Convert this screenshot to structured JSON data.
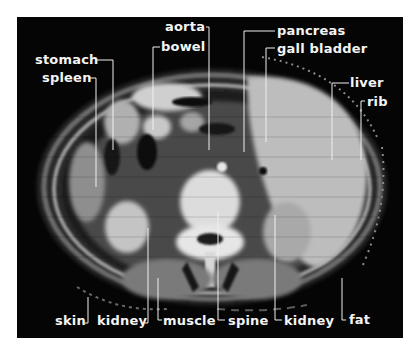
{
  "figure": {
    "background_color": "#ffffff",
    "panel_color": "#050505",
    "label_color": "#f4f4f4",
    "labels": {
      "stomach": "stomach",
      "spleen": "spleen",
      "bowel": "bowel",
      "aorta": "aorta",
      "pancreas": "pancreas",
      "gall_bladder": "gall bladder",
      "liver": "liver",
      "rib": "rib",
      "skin": "skin",
      "kidney_left": "kidney",
      "muscle": "muscle",
      "spine": "spine",
      "kidney_right": "kidney",
      "fat": "fat"
    }
  }
}
